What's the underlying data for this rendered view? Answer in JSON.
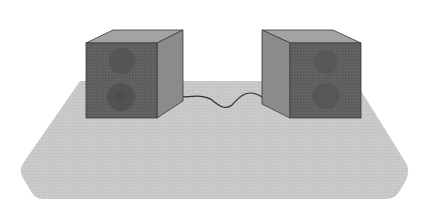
{
  "scene": {
    "description": "Two speaker boxes on a table connected by a cable",
    "width": 432,
    "height": 212,
    "background": "#ffffff"
  },
  "colors": {
    "table": "#c9c9c9",
    "speaker_front": "#5f5f5f",
    "speaker_top": "#a3a3a3",
    "speaker_side": "#8b8b8b",
    "driver": "#525252",
    "outline": "#3a3a3a",
    "cable": "#2e2e2e"
  },
  "objects": [
    {
      "name": "table",
      "type": "surface"
    },
    {
      "name": "left-speaker",
      "drivers": 2
    },
    {
      "name": "right-speaker",
      "drivers": 2
    },
    {
      "name": "cable",
      "connects": [
        "left-speaker",
        "right-speaker"
      ]
    }
  ]
}
